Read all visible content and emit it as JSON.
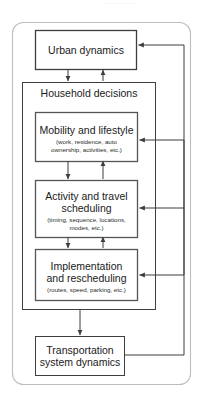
{
  "diagram": {
    "top_clipped_text": "············",
    "container_label": "Household decisions",
    "colors": {
      "stroke": "#3d3d3d",
      "outer_stroke": "#bdbdbd",
      "inner_stroke": "#8c8c8c",
      "text": "#1a1a1a",
      "background": "#ffffff"
    },
    "nodes": [
      {
        "id": "urban-dynamics",
        "title": "Urban dynamics",
        "subtitle": ""
      },
      {
        "id": "household-decisions",
        "title": "Household decisions",
        "subtitle": ""
      },
      {
        "id": "mobility-and-lifestyle",
        "title": "Mobility and lifestyle",
        "subtitle": "(work, residence, auto\nownership, activities, etc.)"
      },
      {
        "id": "activity-and-travel-scheduling",
        "title": "Activity and travel\nscheduling",
        "subtitle": "(timing, sequence, locations,\nmodes, etc.)"
      },
      {
        "id": "implementation-and-rescheduling",
        "title": "Implementation\nand rescheduling",
        "subtitle": "(routes, speed, parking, etc.)"
      },
      {
        "id": "transportation-system-dynamics",
        "title": "Transportation\nsystem dynamics",
        "subtitle": ""
      }
    ],
    "edges": [
      {
        "id": "urban-to-household",
        "from": "urban-dynamics",
        "to": "household-decisions",
        "direction": "down"
      },
      {
        "id": "household-to-urban",
        "from": "household-decisions",
        "to": "urban-dynamics",
        "direction": "up"
      },
      {
        "id": "mobility-to-activity",
        "from": "mobility-and-lifestyle",
        "to": "activity-and-travel-scheduling",
        "direction": "down"
      },
      {
        "id": "activity-to-mobility",
        "from": "activity-and-travel-scheduling",
        "to": "mobility-and-lifestyle",
        "direction": "up"
      },
      {
        "id": "activity-to-implementation",
        "from": "activity-and-travel-scheduling",
        "to": "implementation-and-rescheduling",
        "direction": "down"
      },
      {
        "id": "implementation-to-activity",
        "from": "implementation-and-rescheduling",
        "to": "activity-and-travel-scheduling",
        "direction": "up"
      },
      {
        "id": "household-to-transportation",
        "from": "household-decisions",
        "to": "transportation-system-dynamics",
        "direction": "down"
      },
      {
        "id": "feedback-to-urban-dynamics",
        "from": "transportation-system-dynamics",
        "to": "urban-dynamics",
        "direction": "left"
      },
      {
        "id": "feedback-to-mobility",
        "from": "transportation-system-dynamics",
        "to": "mobility-and-lifestyle",
        "direction": "left"
      },
      {
        "id": "feedback-to-activity",
        "from": "transportation-system-dynamics",
        "to": "activity-and-travel-scheduling",
        "direction": "left"
      },
      {
        "id": "feedback-to-implementation",
        "from": "transportation-system-dynamics",
        "to": "implementation-and-rescheduling",
        "direction": "left"
      }
    ]
  }
}
